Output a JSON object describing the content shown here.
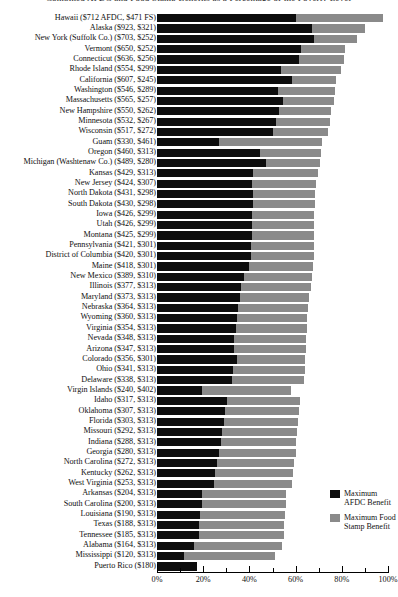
{
  "chart_data": {
    "type": "bar",
    "orientation": "horizontal",
    "stacked": true,
    "title": "Combined AFDC and Food Stamp Benefits as a Percentage of the Poverty Level",
    "xlabel": "",
    "ylabel": "",
    "xlim": [
      0,
      100
    ],
    "tick_labels": [
      "0%",
      "20%",
      "40%",
      "60%",
      "80%",
      "100%"
    ],
    "tick_values": [
      0,
      20,
      40,
      60,
      80,
      100
    ],
    "minor_tick_values": [
      10,
      30,
      50,
      70,
      90
    ],
    "grid": false,
    "legend_position": "bottom-right",
    "colors": {
      "afdc": "#0d0d0d",
      "food_stamp": "#8a8a8a",
      "background": "#ffffff",
      "text": "#111111"
    },
    "legend": [
      {
        "label": "Maximum AFDC Benefit",
        "color": "#0d0d0d"
      },
      {
        "label": "Maximum Food Stamp Benefit",
        "color": "#8a8a8a"
      }
    ],
    "series": [
      {
        "name": "Maximum AFDC Benefit",
        "color": "#0d0d0d"
      },
      {
        "name": "Maximum Food Stamp Benefit",
        "color": "#8a8a8a"
      }
    ],
    "categories": [
      "Hawaii ($712 AFDC, $471 FS)",
      "Alaska ($923, $321)",
      "New York (Suffolk Co.) ($703, $252)",
      "Vermont ($650, $252)",
      "Connecticut ($636, $256)",
      "Rhode Island ($554, $299)",
      "California ($607, $245)",
      "Washington ($546, $289)",
      "Massachusetts ($565, $257)",
      "New Hampshire ($550, $262)",
      "Minnesota ($532, $267)",
      "Wisconsin ($517, $272)",
      "Guam ($330, $461)",
      "Oregon ($460, $313)",
      "Michigan (Washtenaw Co.) ($489, $280)",
      "Kansas ($429, $313)",
      "New Jersey ($424, $307)",
      "North Dakota ($431, $298)",
      "South Dakota ($430, $298)",
      "Iowa ($426, $299)",
      "Utah ($426, $299)",
      "Montana ($425, $299)",
      "Pennsylvania ($421, $301)",
      "District of Columbia ($420, $301)",
      "Maine ($418, $301)",
      "New Mexico ($389, $310)",
      "Illinois ($377, $313)",
      "Maryland ($373, $313)",
      "Nebraska ($364, $313)",
      "Wyoming ($360, $313)",
      "Virginia ($354, $313)",
      "Nevada ($348, $313)",
      "Arizona ($347, $313)",
      "Colorado ($356, $301)",
      "Ohio ($341, $313)",
      "Delaware ($338, $313)",
      "Virgin Islands ($240, $402)",
      "Idaho ($317, $313)",
      "Oklahoma ($307, $313)",
      "Florida ($303, $313)",
      "Missouri ($292, $313)",
      "Indiana ($288, $313)",
      "Georgia ($280, $313)",
      "North Carolina ($272, $313)",
      "Kentucky ($262, $313)",
      "West Virginia ($253, $313)",
      "Arkansas ($204, $313)",
      "South Carolina ($200, $313)",
      "Louisiana ($190, $313)",
      "Texas ($188, $313)",
      "Tennessee ($185, $313)",
      "Alabama ($164, $313)",
      "Mississippi ($120, $313)",
      "Puerto Rico ($180)"
    ],
    "rows": [
      {
        "label": "Hawaii ($712 AFDC, $471 FS)",
        "afdc": 60.0,
        "food_stamp": 38.0
      },
      {
        "label": "Alaska ($923, $321)",
        "afdc": 67.0,
        "food_stamp": 23.0
      },
      {
        "label": "New York (Suffolk Co.) ($703, $252)",
        "afdc": 68.0,
        "food_stamp": 18.5
      },
      {
        "label": "Vermont ($650, $252)",
        "afdc": 62.5,
        "food_stamp": 19.0
      },
      {
        "label": "Connecticut ($636, $256)",
        "afdc": 61.5,
        "food_stamp": 19.5
      },
      {
        "label": "Rhode Island ($554, $299)",
        "afdc": 53.5,
        "food_stamp": 26.0
      },
      {
        "label": "California ($607, $245)",
        "afdc": 58.5,
        "food_stamp": 19.0
      },
      {
        "label": "Washington ($546, $289)",
        "afdc": 52.5,
        "food_stamp": 24.5
      },
      {
        "label": "Massachusetts ($565, $257)",
        "afdc": 54.5,
        "food_stamp": 22.0
      },
      {
        "label": "New Hampshire ($550, $262)",
        "afdc": 53.0,
        "food_stamp": 22.5
      },
      {
        "label": "Minnesota ($532, $267)",
        "afdc": 51.5,
        "food_stamp": 23.5
      },
      {
        "label": "Wisconsin ($517, $272)",
        "afdc": 50.0,
        "food_stamp": 24.0
      },
      {
        "label": "Guam ($330, $461)",
        "afdc": 27.0,
        "food_stamp": 44.5
      },
      {
        "label": "Oregon ($460, $313)",
        "afdc": 44.5,
        "food_stamp": 26.5
      },
      {
        "label": "Michigan (Washtenaw Co.) ($489, $280)",
        "afdc": 47.0,
        "food_stamp": 23.5
      },
      {
        "label": "Kansas ($429, $313)",
        "afdc": 41.5,
        "food_stamp": 28.0
      },
      {
        "label": "New Jersey ($424, $307)",
        "afdc": 41.0,
        "food_stamp": 28.0
      },
      {
        "label": "North Dakota ($431, $298)",
        "afdc": 41.5,
        "food_stamp": 27.0
      },
      {
        "label": "South Dakota ($430, $298)",
        "afdc": 41.5,
        "food_stamp": 27.0
      },
      {
        "label": "Iowa ($426, $299)",
        "afdc": 41.0,
        "food_stamp": 27.0
      },
      {
        "label": "Utah ($426, $299)",
        "afdc": 41.0,
        "food_stamp": 27.0
      },
      {
        "label": "Montana ($425, $299)",
        "afdc": 41.0,
        "food_stamp": 27.0
      },
      {
        "label": "Pennsylvania ($421, $301)",
        "afdc": 40.5,
        "food_stamp": 27.5
      },
      {
        "label": "District of Columbia ($420, $301)",
        "afdc": 40.5,
        "food_stamp": 27.5
      },
      {
        "label": "Maine ($418, $301)",
        "afdc": 40.0,
        "food_stamp": 27.5
      },
      {
        "label": "New Mexico ($389, $310)",
        "afdc": 37.5,
        "food_stamp": 29.5
      },
      {
        "label": "Illinois ($377, $313)",
        "afdc": 36.5,
        "food_stamp": 30.0
      },
      {
        "label": "Maryland ($373, $313)",
        "afdc": 36.0,
        "food_stamp": 30.0
      },
      {
        "label": "Nebraska ($364, $313)",
        "afdc": 35.0,
        "food_stamp": 30.5
      },
      {
        "label": "Wyoming ($360, $313)",
        "afdc": 34.5,
        "food_stamp": 30.5
      },
      {
        "label": "Virginia ($354, $313)",
        "afdc": 34.0,
        "food_stamp": 31.0
      },
      {
        "label": "Nevada ($348, $313)",
        "afdc": 33.5,
        "food_stamp": 31.0
      },
      {
        "label": "Arizona ($347, $313)",
        "afdc": 33.5,
        "food_stamp": 31.0
      },
      {
        "label": "Colorado ($356, $301)",
        "afdc": 34.5,
        "food_stamp": 29.5
      },
      {
        "label": "Ohio ($341, $313)",
        "afdc": 33.0,
        "food_stamp": 31.0
      },
      {
        "label": "Delaware ($338, $313)",
        "afdc": 32.5,
        "food_stamp": 31.0
      },
      {
        "label": "Virgin Islands ($240, $402)",
        "afdc": 19.5,
        "food_stamp": 38.5
      },
      {
        "label": "Idaho ($317, $313)",
        "afdc": 30.5,
        "food_stamp": 31.5
      },
      {
        "label": "Oklahoma ($307, $313)",
        "afdc": 29.5,
        "food_stamp": 32.0
      },
      {
        "label": "Florida ($303, $313)",
        "afdc": 29.0,
        "food_stamp": 32.0
      },
      {
        "label": "Missouri ($292, $313)",
        "afdc": 28.0,
        "food_stamp": 32.5
      },
      {
        "label": "Indiana ($288, $313)",
        "afdc": 27.5,
        "food_stamp": 32.5
      },
      {
        "label": "Georgia ($280, $313)",
        "afdc": 27.0,
        "food_stamp": 33.0
      },
      {
        "label": "North Carolina ($272, $313)",
        "afdc": 26.0,
        "food_stamp": 33.5
      },
      {
        "label": "Kentucky ($262, $313)",
        "afdc": 25.0,
        "food_stamp": 34.0
      },
      {
        "label": "West Virginia ($253, $313)",
        "afdc": 24.5,
        "food_stamp": 34.0
      },
      {
        "label": "Arkansas ($204, $313)",
        "afdc": 19.5,
        "food_stamp": 36.5
      },
      {
        "label": "South Carolina ($200, $313)",
        "afdc": 19.5,
        "food_stamp": 36.5
      },
      {
        "label": "Louisiana ($190, $313)",
        "afdc": 18.5,
        "food_stamp": 37.0
      },
      {
        "label": "Texas ($188, $313)",
        "afdc": 18.0,
        "food_stamp": 37.0
      },
      {
        "label": "Tennessee ($185, $313)",
        "afdc": 18.0,
        "food_stamp": 37.0
      },
      {
        "label": "Alabama ($164, $313)",
        "afdc": 16.0,
        "food_stamp": 38.0
      },
      {
        "label": "Mississippi ($120, $313)",
        "afdc": 11.5,
        "food_stamp": 39.5
      },
      {
        "label": "Puerto Rico ($180)",
        "afdc": 17.5,
        "food_stamp": 0
      }
    ]
  }
}
